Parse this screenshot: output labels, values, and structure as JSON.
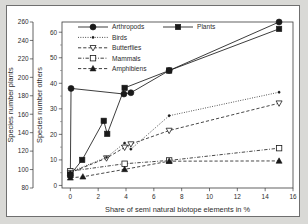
{
  "figure": {
    "background_color": "#d9d9d6",
    "panel_color": "#ffffff",
    "frame_color": "#6f6f6f",
    "ink_color": "#1a1a1a"
  },
  "axes": {
    "x": {
      "label": "Share of semi natural biotope elements in %",
      "ticks": [
        0,
        2,
        4,
        6,
        8,
        10,
        12,
        14,
        16
      ],
      "min": -0.6,
      "max": 16
    },
    "y_left_outer": {
      "label": "Species number plants",
      "ticks": [
        80,
        100,
        120,
        140,
        160,
        180,
        200,
        220,
        240,
        260
      ],
      "min": 80,
      "max": 260
    },
    "y_left_inner": {
      "label": "Species number others",
      "ticks": [
        0,
        10,
        20,
        30,
        40,
        50,
        60
      ],
      "min": -1,
      "max": 64
    }
  },
  "legend": {
    "items": [
      {
        "label": "Arthropods",
        "marker": "filled-circle",
        "line": "solid",
        "column": 1
      },
      {
        "label": "Plants",
        "marker": "filled-square",
        "line": "solid",
        "column": 2
      },
      {
        "label": "Birds",
        "marker": "small-dot",
        "line": "dotted",
        "column": 1
      },
      {
        "label": "Butterflies",
        "marker": "open-triangle-down",
        "line": "dashed",
        "column": 1
      },
      {
        "label": "Mammals",
        "marker": "open-square",
        "line": "dash-dot",
        "column": 1
      },
      {
        "label": "Amphibiens",
        "marker": "filled-triangle-up",
        "line": "dashed",
        "column": 1
      }
    ]
  },
  "chart_data": {
    "type": "line",
    "title": "",
    "xlabel": "Share of semi natural biotope elements in %",
    "ylabel": "Species number others",
    "ylabel_secondary": "Species number plants",
    "xlim": [
      -0.6,
      16
    ],
    "ylim": [
      -1,
      64
    ],
    "ylim_secondary": [
      80,
      260
    ],
    "grid": false,
    "legend_position": "top-left inside",
    "series": [
      {
        "name": "Arthropods",
        "marker": "filled-circle",
        "line": "solid",
        "axis": "left-inner",
        "points": [
          [
            0.0,
            4.0
          ],
          [
            0.05,
            38.0
          ],
          [
            3.85,
            35.8
          ],
          [
            4.35,
            36.3
          ],
          [
            7.1,
            45.0
          ],
          [
            15.0,
            64.0
          ]
        ]
      },
      {
        "name": "Plants",
        "marker": "filled-square",
        "line": "solid",
        "axis": "left-inner",
        "points": [
          [
            0.0,
            4.2
          ],
          [
            0.85,
            10.0
          ],
          [
            2.4,
            25.3
          ],
          [
            2.65,
            20.2
          ],
          [
            3.9,
            38.2
          ],
          [
            7.1,
            45.0
          ],
          [
            15.0,
            61.3
          ]
        ]
      },
      {
        "name": "Birds",
        "marker": "small-dot",
        "line": "dotted",
        "axis": "left-inner",
        "points": [
          [
            0.0,
            5.3
          ],
          [
            2.6,
            11.0
          ],
          [
            3.9,
            16.6
          ],
          [
            4.35,
            14.2
          ],
          [
            7.1,
            27.3
          ],
          [
            15.0,
            36.5
          ]
        ]
      },
      {
        "name": "Butterflies",
        "marker": "open-triangle-down",
        "line": "dashed",
        "axis": "left-inner",
        "points": [
          [
            0.0,
            5.0
          ],
          [
            2.6,
            10.7
          ],
          [
            3.9,
            14.9
          ],
          [
            4.35,
            16.2
          ],
          [
            7.1,
            21.5
          ],
          [
            15.0,
            32.2
          ]
        ]
      },
      {
        "name": "Mammals",
        "marker": "open-square",
        "line": "dash-dot",
        "axis": "left-inner",
        "points": [
          [
            0.0,
            5.6
          ],
          [
            3.9,
            8.5
          ],
          [
            7.1,
            9.8
          ],
          [
            15.0,
            14.6
          ]
        ]
      },
      {
        "name": "Amphibiens",
        "marker": "filled-triangle-up",
        "line": "dashed",
        "axis": "left-inner",
        "points": [
          [
            0.0,
            3.0
          ],
          [
            0.9,
            3.4
          ],
          [
            3.9,
            6.3
          ],
          [
            7.1,
            9.5
          ],
          [
            15.0,
            9.6
          ]
        ]
      }
    ]
  }
}
